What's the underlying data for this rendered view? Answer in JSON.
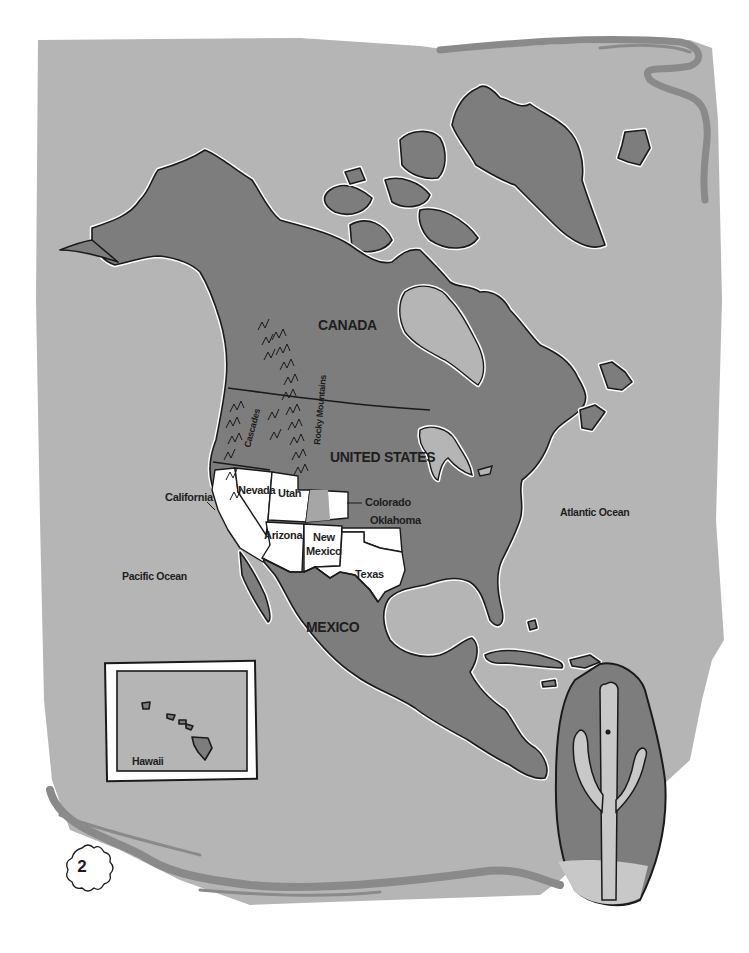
{
  "page": {
    "page_number": "2",
    "background_color": "#ffffff",
    "paper_color": "#b5b5b5",
    "land_color": "#7d7d7d",
    "highlight_state_color": "#ffffff",
    "outline_color": "#1a1a1a"
  },
  "map": {
    "title_region": "North America",
    "countries": {
      "canada": "CANADA",
      "united_states": "UNITED STATES",
      "mexico": "MEXICO"
    },
    "states": {
      "california": "California",
      "nevada": "Nevada",
      "utah": "Utah",
      "colorado": "Colorado",
      "oklahoma": "Oklahoma",
      "arizona": "Arizona",
      "new_mexico_line1": "New",
      "new_mexico_line2": "Mexico",
      "texas": "Texas"
    },
    "oceans": {
      "atlantic": "Atlantic Ocean",
      "pacific": "Pacific Ocean"
    },
    "mountains": {
      "cascades": "Cascades",
      "rocky": "Rocky Mountains"
    }
  },
  "inset": {
    "label": "Hawaii"
  },
  "illustration": {
    "subject": "saguaro-cactus"
  }
}
